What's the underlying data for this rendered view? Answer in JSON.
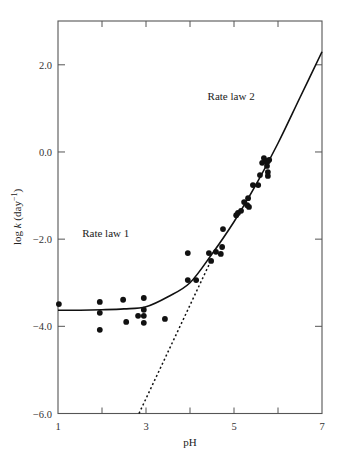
{
  "chart_data": {
    "type": "scatter",
    "title": "",
    "xlabel": "pH",
    "ylabel": "log k (day⁻¹)",
    "ylabel_parts": {
      "prefix": "log ",
      "italic": "k",
      "suffix": " (day",
      "sup": "−1",
      "close": ")"
    },
    "xlim": [
      1,
      7
    ],
    "ylim": [
      -6.0,
      3.0
    ],
    "x_ticks": [
      1,
      2,
      3,
      4,
      5,
      6,
      7
    ],
    "x_tick_labels": [
      {
        "value": 1,
        "label": "1"
      },
      {
        "value": 3,
        "label": "3"
      },
      {
        "value": 5,
        "label": "5"
      },
      {
        "value": 7,
        "label": "7"
      }
    ],
    "y_ticks": [
      {
        "value": 2.0,
        "label": "2.0"
      },
      {
        "value": 0.0,
        "label": "0.0"
      },
      {
        "value": -2.0,
        "label": "−2.0"
      },
      {
        "value": -4.0,
        "label": "−4.0"
      },
      {
        "value": -6.0,
        "label": "−6.0"
      }
    ],
    "grid": false,
    "legend": null,
    "annotations": [
      {
        "text": "Rate law  1",
        "x": 1.55,
        "y": -1.95
      },
      {
        "text": "Rate law 2",
        "x": 4.4,
        "y": 1.2
      }
    ],
    "series": [
      {
        "name": "Observed rate constants",
        "kind": "scatter",
        "marker": "filled-circle",
        "color": "#111111",
        "points": [
          [
            1.02,
            -3.49
          ],
          [
            1.95,
            -3.44
          ],
          [
            1.95,
            -3.69
          ],
          [
            1.95,
            -4.08
          ],
          [
            2.48,
            -3.39
          ],
          [
            2.55,
            -3.9
          ],
          [
            2.82,
            -3.76
          ],
          [
            2.95,
            -3.35
          ],
          [
            2.95,
            -3.62
          ],
          [
            2.95,
            -3.76
          ],
          [
            2.95,
            -3.92
          ],
          [
            3.43,
            -3.83
          ],
          [
            3.95,
            -2.32
          ],
          [
            3.95,
            -2.94
          ],
          [
            4.14,
            -2.94
          ],
          [
            4.43,
            -2.32
          ],
          [
            4.48,
            -2.5
          ],
          [
            4.59,
            -2.29
          ],
          [
            4.7,
            -2.34
          ],
          [
            4.73,
            -2.18
          ],
          [
            4.75,
            -1.77
          ],
          [
            5.05,
            -1.45
          ],
          [
            5.09,
            -1.4
          ],
          [
            5.16,
            -1.35
          ],
          [
            5.23,
            -1.15
          ],
          [
            5.3,
            -1.22
          ],
          [
            5.32,
            -1.06
          ],
          [
            5.34,
            -1.26
          ],
          [
            5.43,
            -0.76
          ],
          [
            5.55,
            -0.76
          ],
          [
            5.59,
            -0.53
          ],
          [
            5.64,
            -0.25
          ],
          [
            5.68,
            -0.14
          ],
          [
            5.73,
            -0.21
          ],
          [
            5.75,
            -0.32
          ],
          [
            5.77,
            -0.21
          ],
          [
            5.77,
            -0.46
          ],
          [
            5.8,
            -0.18
          ],
          [
            5.77,
            -0.55
          ]
        ]
      },
      {
        "name": "Combined rate law fit",
        "kind": "line",
        "style": "solid",
        "color": "#111111",
        "points": [
          [
            1.0,
            -3.63
          ],
          [
            1.5,
            -3.63
          ],
          [
            2.0,
            -3.62
          ],
          [
            2.5,
            -3.6
          ],
          [
            3.0,
            -3.55
          ],
          [
            3.5,
            -3.32
          ],
          [
            4.0,
            -3.0
          ],
          [
            4.5,
            -2.34
          ],
          [
            5.0,
            -1.6
          ],
          [
            5.5,
            -0.75
          ],
          [
            6.0,
            0.2
          ],
          [
            6.5,
            1.25
          ],
          [
            7.0,
            2.3
          ]
        ]
      },
      {
        "name": "Rate law 2 extrapolation",
        "kind": "line",
        "style": "dotted",
        "color": "#111111",
        "points": [
          [
            2.84,
            -6.0
          ],
          [
            4.45,
            -2.55
          ]
        ]
      }
    ]
  }
}
